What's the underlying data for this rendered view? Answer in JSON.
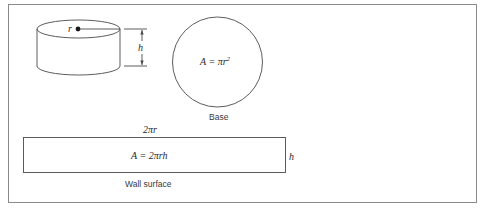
{
  "figure": {
    "cylinder": {
      "radius_label": "r",
      "height_label": "h"
    },
    "base": {
      "formula_prefix": "A = πr",
      "formula_exponent": "2",
      "caption": "Base"
    },
    "wall": {
      "width_label": "2πr",
      "height_label": "h",
      "formula": "A = 2πrh",
      "caption": "Wall surface"
    },
    "colors": {
      "stroke": "#4a4a4a",
      "frame": "#8a8a8a",
      "text": "#2a2a2a"
    }
  }
}
